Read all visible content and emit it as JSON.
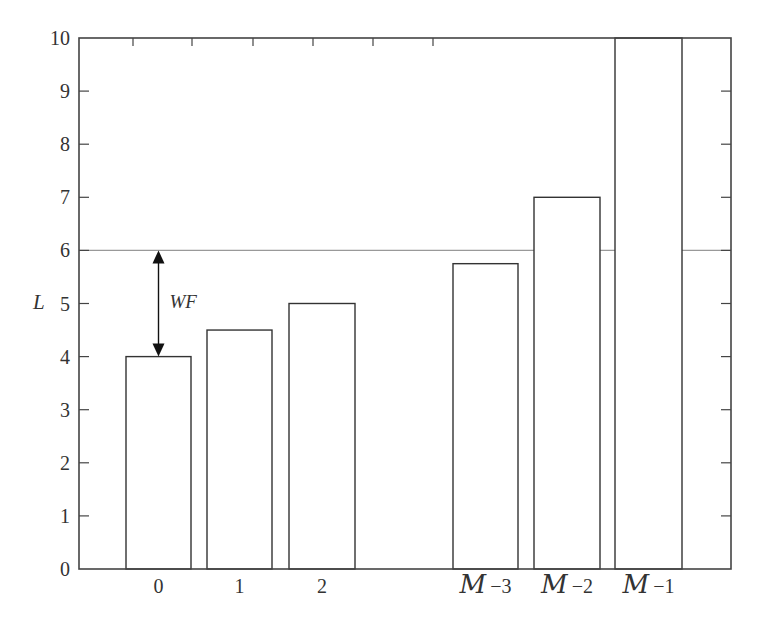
{
  "chart_data": {
    "type": "bar",
    "title": "",
    "xlabel": "",
    "ylabel": "L",
    "ylim": [
      0,
      10
    ],
    "yticks": [
      0,
      1,
      2,
      3,
      4,
      5,
      6,
      7,
      8,
      9,
      10
    ],
    "grid": false,
    "legend": null,
    "categories": [
      "0",
      "1",
      "2",
      "M-3",
      "M-2",
      "M-1"
    ],
    "category_display": [
      {
        "script": "",
        "rest": "0"
      },
      {
        "script": "",
        "rest": "1"
      },
      {
        "script": "",
        "rest": "2"
      },
      {
        "script": "M",
        "rest": "−3"
      },
      {
        "script": "M",
        "rest": "−2"
      },
      {
        "script": "M",
        "rest": "−1"
      }
    ],
    "values": [
      4.0,
      4.5,
      5.0,
      5.75,
      7.0,
      10.0
    ],
    "threshold": {
      "value": 6,
      "color": "#999999"
    },
    "annotations": [
      {
        "text": "WF",
        "type": "double-arrow",
        "from": 4,
        "to": 6,
        "category": "0"
      }
    ],
    "colors": {
      "bar_fill": "#ffffff",
      "bar_edge": "#333333",
      "axis": "#444444"
    }
  }
}
